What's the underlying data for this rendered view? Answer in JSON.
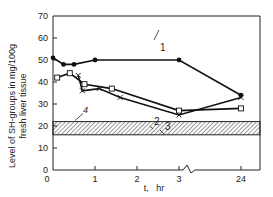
{
  "chart_data": {
    "type": "line",
    "title": "",
    "xlabel": "t,   hr",
    "ylabel_line1": "Level of SH-groups in mg/100g",
    "ylabel_line2": "fresh liver tissue",
    "ylim": [
      0,
      70
    ],
    "yticks": [
      "0",
      "10",
      "20",
      "30",
      "40",
      "50",
      "60",
      "70"
    ],
    "xticks": [
      "0",
      "1",
      "2",
      "3",
      "24"
    ],
    "x_axis_break": "between 3 and 24",
    "grid": false,
    "series": [
      {
        "name": "1",
        "marker": "filled-circle",
        "points": [
          [
            0,
            51
          ],
          [
            0.25,
            48
          ],
          [
            0.5,
            48
          ],
          [
            1,
            50
          ],
          [
            3,
            50
          ],
          [
            24,
            34
          ]
        ]
      },
      {
        "name": "2",
        "marker": "open-square",
        "points": [
          [
            0.1,
            42
          ],
          [
            0.4,
            44
          ],
          [
            0.75,
            39
          ],
          [
            1.4,
            37
          ],
          [
            3,
            27
          ],
          [
            24,
            28
          ]
        ]
      },
      {
        "name": "3",
        "marker": "cross",
        "points": [
          [
            0.6,
            43
          ],
          [
            0.7,
            36
          ],
          [
            1.1,
            37
          ],
          [
            1.6,
            33
          ],
          [
            3,
            25
          ],
          [
            24,
            33
          ]
        ]
      }
    ],
    "band": {
      "name": "4",
      "range": [
        16,
        22
      ],
      "style": "hatched"
    }
  }
}
